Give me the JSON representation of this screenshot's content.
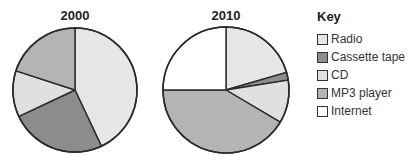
{
  "chart_data": [
    {
      "type": "pie",
      "title": "2000",
      "categories": [
        "Radio",
        "Cassette tape",
        "CD",
        "MP3 player",
        "Internet"
      ],
      "values": [
        43,
        25,
        12,
        20,
        0
      ],
      "unit": "percent (estimated)"
    },
    {
      "type": "pie",
      "title": "2010",
      "categories": [
        "Radio",
        "Cassette tape",
        "CD",
        "MP3 player",
        "Internet"
      ],
      "values": [
        20.5,
        2,
        11,
        41.5,
        25
      ],
      "unit": "percent (estimated)"
    }
  ],
  "legend": {
    "title": "Key",
    "position": "right",
    "items": [
      {
        "label": "Radio",
        "color": "#e6e6e6"
      },
      {
        "label": "Cassette tape",
        "color": "#8c8c8c"
      },
      {
        "label": "CD",
        "color": "#e0e0e0"
      },
      {
        "label": "MP3 player",
        "color": "#b4b4b4"
      },
      {
        "label": "Internet",
        "color": "#ffffff"
      }
    ]
  },
  "pies": [
    {
      "title": "2000",
      "cx": 75,
      "cy": 90,
      "r": 62
    },
    {
      "title": "2010",
      "cx": 226,
      "cy": 90,
      "r": 63
    }
  ]
}
